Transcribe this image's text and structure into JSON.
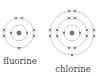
{
  "diagram": {
    "type": "bohr-model-electron-shells",
    "atoms": [
      {
        "name": "fluorine",
        "label": "fluorine",
        "shells": [
          2,
          7
        ],
        "center": [
          19,
          33
        ],
        "shell_radii": [
          8,
          15
        ]
      },
      {
        "name": "chlorine",
        "label": "chlorine",
        "shells": [
          2,
          8,
          7
        ],
        "center": [
          72,
          33
        ],
        "shell_radii": [
          8,
          15,
          22
        ]
      }
    ],
    "electron_symbol": "×",
    "colors": {
      "shell": "#a8a8a8",
      "electron": "#555555",
      "nucleus": "#777777",
      "text": "#444444"
    }
  }
}
